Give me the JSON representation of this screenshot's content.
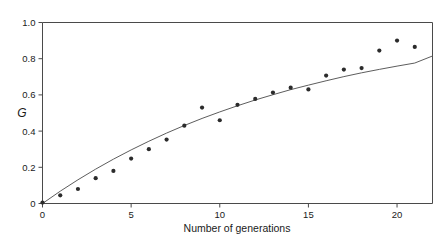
{
  "chart_data": {
    "type": "scatter",
    "title": "",
    "xlabel": "Number of generations",
    "ylabel": "G",
    "xlim": [
      0,
      22
    ],
    "ylim": [
      0,
      1.0
    ],
    "xticks": [
      0,
      5,
      10,
      15,
      20
    ],
    "xticklabels": [
      "0",
      "5",
      "10",
      "15",
      "20"
    ],
    "yticks": [
      0,
      0.2,
      0.4,
      0.6,
      0.8,
      1.0
    ],
    "yticklabels": [
      "0",
      "0.2",
      "0.4",
      "0.6",
      "0.8",
      "1.0"
    ],
    "grid": false,
    "legend": null,
    "legend_position": "none",
    "marker_color": "#2b2b2b",
    "line_color": "#5d5d5d",
    "axis_color": "#4a4a4a",
    "background_color": "#ffffff",
    "series": [
      {
        "name": "Observed G",
        "style": "points",
        "x": [
          0,
          1,
          2,
          3,
          4,
          5,
          6,
          7,
          8,
          9,
          10,
          11,
          12,
          13,
          14,
          15,
          16,
          17,
          18,
          19,
          20,
          21
        ],
        "values": [
          0.005,
          0.045,
          0.08,
          0.14,
          0.18,
          0.248,
          0.3,
          0.353,
          0.43,
          0.53,
          0.46,
          0.545,
          0.578,
          0.613,
          0.64,
          0.63,
          0.707,
          0.74,
          0.748,
          0.845,
          0.9,
          0.865
        ]
      },
      {
        "name": "Fitted curve",
        "style": "line",
        "x": [
          0,
          1,
          2,
          3,
          4,
          5,
          6,
          7,
          8,
          9,
          10,
          11,
          12,
          13,
          14,
          15,
          16,
          17,
          18,
          19,
          20,
          21,
          22
        ],
        "values": [
          0.0,
          0.068,
          0.131,
          0.19,
          0.245,
          0.296,
          0.344,
          0.389,
          0.431,
          0.47,
          0.506,
          0.54,
          0.572,
          0.601,
          0.629,
          0.654,
          0.678,
          0.701,
          0.722,
          0.741,
          0.759,
          0.776,
          0.815
        ]
      }
    ]
  },
  "figure": {
    "caption": ""
  }
}
